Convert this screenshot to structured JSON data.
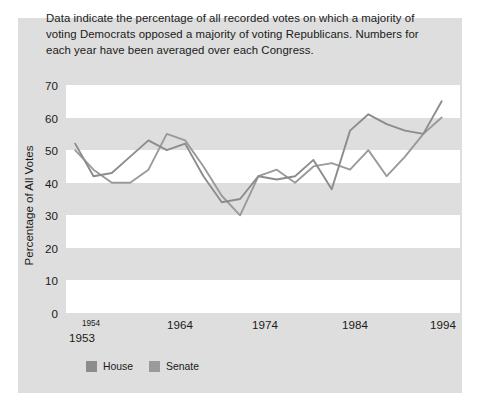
{
  "figure": {
    "caption": "Data indicate the percentage of all recorded votes on which a majority of voting Democrats opposed a majority of voting Republicans. Numbers for each year have been averaged over each Congress.",
    "card_background": "#dedede",
    "band_color": "#ffffff"
  },
  "legend": {
    "items": [
      {
        "label": "House",
        "color": "#8c8c8c"
      },
      {
        "label": "Senate",
        "color": "#9a9a9a"
      }
    ]
  },
  "axis": {
    "y_title": "Percentage of All Votes",
    "y_ticks": [
      "70",
      "60",
      "50",
      "40",
      "30",
      "20",
      "10",
      "0"
    ],
    "x_ticks": [
      "1954",
      "1964",
      "1974",
      "1984",
      "1994"
    ],
    "x_extra_label": "1953"
  },
  "chart_data": {
    "type": "line",
    "title": "",
    "subtitle": "",
    "caption": "Data indicate the percentage of all recorded votes on which a majority of voting Democrats opposed a majority of voting Republicans. Numbers for each year have been averaged over each Congress.",
    "xlabel": "",
    "ylabel": "Percentage of All Votes",
    "xlim": [
      1952,
      1995
    ],
    "ylim": [
      0,
      70
    ],
    "y_ticks": [
      0,
      10,
      20,
      30,
      40,
      50,
      60,
      70
    ],
    "x_ticks": [
      1954,
      1964,
      1974,
      1984,
      1994
    ],
    "grid": "alternating horizontal bands (white between 0-10, 20-30, 40-50, 60-70)",
    "legend_position": "below-left",
    "x": [
      1953,
      1955,
      1957,
      1959,
      1961,
      1963,
      1965,
      1967,
      1969,
      1971,
      1973,
      1975,
      1977,
      1979,
      1981,
      1983,
      1985,
      1987,
      1989,
      1991,
      1993
    ],
    "series": [
      {
        "name": "House",
        "color": "#8c8c8c",
        "values": [
          52,
          42,
          43,
          48,
          53,
          50,
          52,
          42,
          34,
          35,
          42,
          41,
          42,
          47,
          38,
          56,
          61,
          58,
          56,
          55,
          65
        ]
      },
      {
        "name": "Senate",
        "color": "#9a9a9a",
        "values": [
          50,
          44,
          40,
          40,
          44,
          55,
          53,
          45,
          36,
          30,
          42,
          44,
          40,
          45,
          46,
          44,
          50,
          42,
          48,
          55,
          60
        ]
      }
    ],
    "annotations": []
  }
}
